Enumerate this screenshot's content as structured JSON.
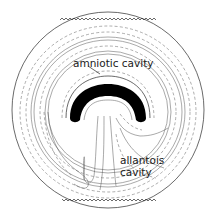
{
  "diagram": {
    "labels": {
      "amniotic": "amniotic cavity",
      "allantois_line1": "allantois",
      "allantois_line2": "cavity"
    },
    "colors": {
      "background": "#ffffff",
      "line": "#2a2a2a",
      "dashed": "#777777",
      "embryo": "#000000"
    }
  }
}
